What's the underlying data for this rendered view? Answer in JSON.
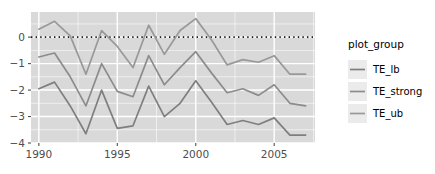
{
  "chart_data": {
    "type": "line",
    "title": "",
    "xlabel": "",
    "ylabel": "",
    "x": [
      1990,
      1991,
      1992,
      1993,
      1994,
      1995,
      1996,
      1997,
      1998,
      1999,
      2000,
      2001,
      2002,
      2003,
      2004,
      2005,
      2006,
      2007
    ],
    "series": [
      {
        "name": "TE_lb",
        "color": "#7f7f7f",
        "values": [
          -1.95,
          -1.7,
          -2.6,
          -3.65,
          -2.0,
          -3.45,
          -3.35,
          -1.85,
          -3.0,
          -2.5,
          -1.65,
          -2.45,
          -3.3,
          -3.15,
          -3.3,
          -3.05,
          -3.7,
          -3.7
        ]
      },
      {
        "name": "TE_strong",
        "color": "#8c8c8c",
        "values": [
          -0.75,
          -0.6,
          -1.5,
          -2.6,
          -1.0,
          -2.05,
          -2.25,
          -0.7,
          -1.8,
          -1.15,
          -0.55,
          -1.35,
          -2.1,
          -1.95,
          -2.2,
          -1.8,
          -2.5,
          -2.6
        ]
      },
      {
        "name": "TE_ub",
        "color": "#999999",
        "values": [
          0.3,
          0.6,
          0.05,
          -1.4,
          0.25,
          -0.35,
          -1.15,
          0.45,
          -0.65,
          0.25,
          0.7,
          -0.1,
          -1.05,
          -0.85,
          -0.95,
          -0.7,
          -1.4,
          -1.4
        ]
      }
    ],
    "xlim": [
      1989.5,
      2007.6
    ],
    "ylim": [
      -4.0,
      0.95
    ],
    "xticks": [
      1990,
      1995,
      2000,
      2005
    ],
    "xtick_labels": [
      "1990",
      "1995",
      "2000",
      "2005"
    ],
    "yticks": [
      0,
      -1,
      -2,
      -3,
      -4
    ],
    "ytick_labels": [
      "0",
      "-1",
      "-2",
      "-3",
      "-4"
    ],
    "grid": true,
    "grid_color": "#ffffff",
    "panel_color": "#d9d9d9",
    "reference_line": {
      "y": 0,
      "style": "dotted",
      "color": "#1a1a1a"
    },
    "legend_position": "right",
    "legend": {
      "title": "plot_group",
      "entries": [
        "TE_lb",
        "TE_strong",
        "TE_ub"
      ]
    }
  },
  "axes": {
    "y_labels": [
      "0",
      "-1",
      "-2",
      "-3",
      "-4"
    ],
    "x_labels": [
      "1990",
      "1995",
      "2000",
      "2005"
    ]
  },
  "legend": {
    "title": "plot_group",
    "items": [
      {
        "label": "TE_lb"
      },
      {
        "label": "TE_strong"
      },
      {
        "label": "TE_ub"
      }
    ]
  }
}
